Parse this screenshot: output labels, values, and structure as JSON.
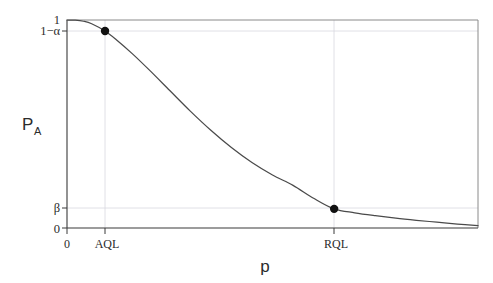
{
  "chart_data": {
    "type": "line",
    "title": "",
    "subtitle": "",
    "xlabel": "p",
    "ylabel": "P",
    "ylabel_sub": "A",
    "xlim": [
      0,
      1
    ],
    "ylim": [
      0,
      1
    ],
    "grid": true,
    "legend": null,
    "y_ticks": [
      {
        "value": 1.0,
        "label": "1"
      },
      {
        "value": 0.947,
        "label": "1−α"
      },
      {
        "value": 0.092,
        "label": "β"
      },
      {
        "value": 0.0,
        "label": "0"
      }
    ],
    "x_ticks": [
      {
        "value": 0.0,
        "label": "0"
      },
      {
        "value": 0.0925,
        "label": "AQL"
      },
      {
        "value": 0.65,
        "label": "RQL"
      }
    ],
    "series": [
      {
        "name": "OC curve",
        "x": [
          0.0,
          0.02,
          0.04,
          0.06,
          0.0925,
          0.12,
          0.16,
          0.2,
          0.25,
          0.3,
          0.35,
          0.4,
          0.45,
          0.5,
          0.55,
          0.6,
          0.65,
          0.7,
          0.75,
          0.8,
          0.85,
          0.9,
          0.95,
          1.0
        ],
        "y": [
          1.0,
          0.999,
          0.994,
          0.982,
          0.947,
          0.905,
          0.836,
          0.76,
          0.661,
          0.562,
          0.47,
          0.387,
          0.315,
          0.255,
          0.205,
          0.143,
          0.092,
          0.073,
          0.059,
          0.047,
          0.037,
          0.028,
          0.019,
          0.011
        ]
      }
    ],
    "annotations": [
      {
        "name": "aql-point",
        "x": 0.0925,
        "y": 0.947,
        "marker": "filled-circle"
      },
      {
        "name": "rql-point",
        "x": 0.65,
        "y": 0.092,
        "marker": "filled-circle"
      }
    ]
  },
  "labels": {
    "y_top": "1",
    "y_one_minus_alpha": "1−α",
    "y_beta": "β",
    "y_zero": "0",
    "x_zero": "0",
    "x_aql": "AQL",
    "x_rql": "RQL",
    "y_axis_title": "P",
    "y_axis_title_sub": "A",
    "x_axis_title": "p"
  },
  "colors": {
    "curve": "#4a4a4a",
    "marker": "#111111",
    "axis": "#3a3a3a",
    "frame": "#8a8a8a",
    "grid": "#d8d8e0",
    "background": "#ffffff"
  }
}
